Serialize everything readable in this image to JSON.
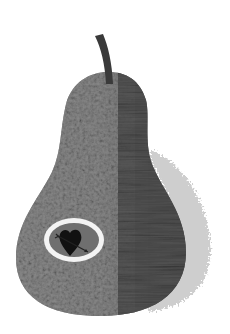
{
  "image": {
    "subject": "pear",
    "description": "Grayscale illustration of a pear with a stem, mottled texture, and an oval inset containing a heart pierced by an arrow",
    "colors": {
      "background": "#ffffff",
      "pear_light": "#8f8f8f",
      "pear_mid": "#7a7a7a",
      "pear_dark": "#4a4a4a",
      "stem": "#3a3a3a",
      "shadow": "#c8c8c8",
      "inset_ring": "#f2f2f2",
      "inset_fill": "#6e6e6e",
      "heart": "#111111"
    },
    "elements": [
      {
        "name": "stem",
        "position": "top center"
      },
      {
        "name": "pear-body",
        "position": "center"
      },
      {
        "name": "shadow",
        "position": "right side"
      },
      {
        "name": "heart-inset",
        "position": "lower left of pear"
      }
    ]
  }
}
